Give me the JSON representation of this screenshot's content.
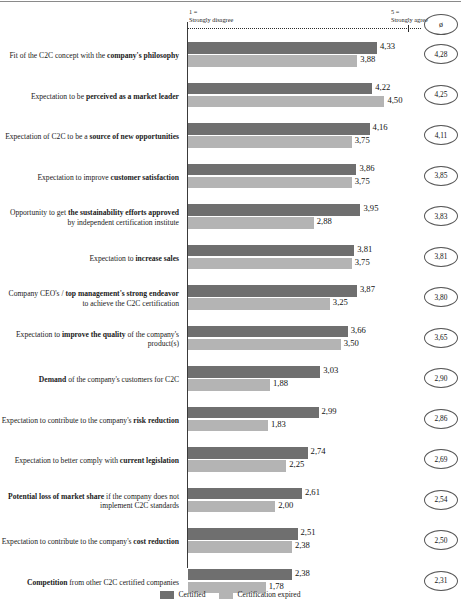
{
  "chart_data": {
    "type": "bar",
    "title": "",
    "orientation": "horizontal",
    "xlabel": "",
    "ylabel": "",
    "xlim": [
      1,
      5
    ],
    "grid": false,
    "scale_left_line1": "1 =",
    "scale_left_line2": "Strongly disagree",
    "scale_right_line1": "5 =",
    "scale_right_line2": "Strongly agree",
    "average_header": "ø",
    "legend_position": "bottom-center",
    "series": [
      {
        "name": "Certified",
        "color": "#6f6f6f",
        "values": [
          4.33,
          4.22,
          4.16,
          3.86,
          3.95,
          3.81,
          3.87,
          3.66,
          3.03,
          2.99,
          2.74,
          2.61,
          2.51,
          2.38
        ],
        "labels": [
          "4,33",
          "4,22",
          "4,16",
          "3,86",
          "3,95",
          "3,81",
          "3,87",
          "3,66",
          "3,03",
          "2,99",
          "2,74",
          "2,61",
          "2,51",
          "2,38"
        ]
      },
      {
        "name": "Certification expired",
        "color": "#b4b4b4",
        "values": [
          3.88,
          4.5,
          3.75,
          3.75,
          2.88,
          3.75,
          3.25,
          3.5,
          1.88,
          1.83,
          2.25,
          2.0,
          2.38,
          1.78
        ],
        "labels": [
          "3,88",
          "4,50",
          "3,75",
          "3,75",
          "2,88",
          "3,75",
          "3,25",
          "3,50",
          "1,88",
          "1,83",
          "2,25",
          "2,00",
          "2,38",
          "1,78"
        ]
      }
    ],
    "averages": [
      "4,28",
      "4,25",
      "4,11",
      "3,85",
      "3,83",
      "3,81",
      "3,80",
      "3,65",
      "2,90",
      "2,86",
      "2,69",
      "2,54",
      "2,50",
      "2,31"
    ],
    "categories": [
      "Fit of the C2C concept with the company's philosophy",
      "Expectation to be perceived as a market leader",
      "Expectation of C2C to be a source of new opportunities",
      "Expectation to improve customer satisfaction",
      "Opportunity to get the sustainability efforts approved by independent certification institute",
      "Expectation to increase sales",
      "Company CEO's / top management's strong endeavor to achieve the C2C certification",
      "Expectation to improve the quality of the company's product(s)",
      "Demand of the company's customers for C2C",
      "Expectation to contribute to the company's risk reduction",
      "Expectation to better comply with current legislation",
      "Potential loss of market share if the company does not implement C2C standards",
      "Expectation to contribute to the company's cost reduction",
      "Competition from other C2C certified companies"
    ],
    "categories_html": [
      "Fit of the C2C concept with the <b>company's philosophy</b>",
      "Expectation to be <b>perceived as a market leader</b>",
      "Expectation of C2C to be a <b>source of new opportunities</b>",
      "Expectation to improve <b>customer satisfaction</b>",
      "Opportunity to get <b>the sustainability efforts approved</b> by independent certification institute",
      "Expectation to <b>increase sales</b>",
      "Company CEO's / <b>top management's strong endeavor</b> to achieve the C2C certification",
      "Expectation to <b>improve the quality</b> of the company's product(s)",
      "<b>Demand</b> of the company's customers for C2C",
      "Expectation to contribute to the company's <b>risk reduction</b>",
      "Expectation to better comply with <b>current legislation</b>",
      "<b>Potential loss of market share</b> if the company does not implement C2C standards",
      "Expectation to contribute to the company's <b>cost reduction</b>",
      "<b>Competition</b> from other C2C certified companies"
    ]
  }
}
